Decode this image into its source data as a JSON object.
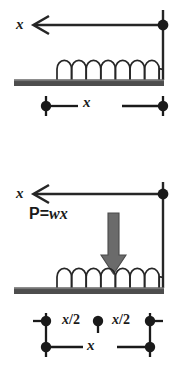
{
  "diagram": {
    "colors": {
      "ink": "#1a1a1a",
      "line": "#262626",
      "ground": "#4d4d4d",
      "ground_top": "#6e6e6e",
      "arrow_fill": "#6b6b6b",
      "arrow_edge": "#4a4a4a",
      "background": "#ffffff"
    },
    "top_figure": {
      "arrow_label": "x",
      "dimension_label": "x",
      "spring_coils": 9,
      "arrow_direction": "left",
      "node_count": 3
    },
    "bottom_figure": {
      "arrow_label": "x",
      "load_label_P": "P",
      "load_label_eq": "=",
      "load_label_wx": "wx",
      "force_arrow_direction": "down",
      "spring_coils": 9,
      "dimension_half_left": "x/2",
      "dimension_half_right": "x/2",
      "dimension_full": "x",
      "node_count": 5
    }
  }
}
